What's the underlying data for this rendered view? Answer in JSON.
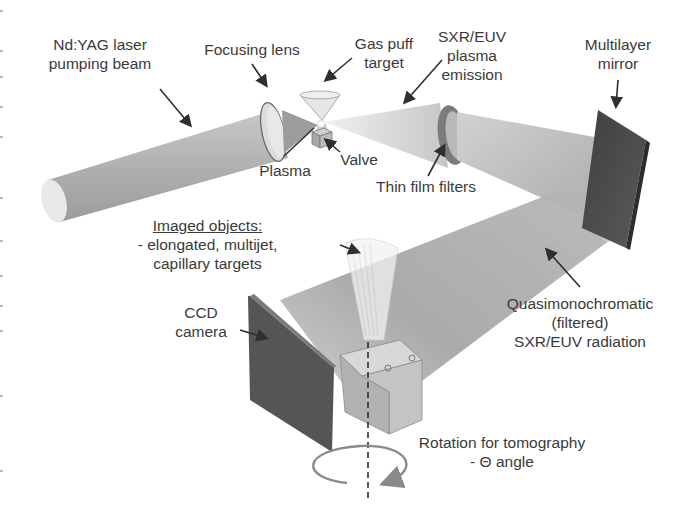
{
  "diagram": {
    "labels": {
      "laser_beam": [
        "Nd:YAG laser",
        "pumping beam"
      ],
      "focusing_lens": [
        "Focusing lens"
      ],
      "gas_puff_target": [
        "Gas puff",
        "target"
      ],
      "plasma_emission": [
        "SXR/EUV",
        "plasma",
        "emission"
      ],
      "multilayer_mirror": [
        "Multilayer",
        "mirror"
      ],
      "plasma": [
        "Plasma"
      ],
      "valve": [
        "Valve"
      ],
      "thin_film_filters": [
        "Thin film filters"
      ],
      "imaged_objects": {
        "heading": "Imaged objects:",
        "lines": [
          "- elongated, multijet,",
          "capillary targets"
        ]
      },
      "ccd_camera": [
        "CCD",
        "camera"
      ],
      "filtered_radiation": [
        "Quasimonochromatic",
        "(filtered)",
        "SXR/EUV radiation"
      ],
      "rotation": [
        "Rotation for tomography",
        "- Θ angle"
      ]
    },
    "colors": {
      "beam_light": "#e8e8e8",
      "beam_mid": "#c4c4c4",
      "beam_dark": "#9a9a9a",
      "mirror": "#4a4a4a",
      "ccd": "#5a5a5a",
      "filter_ring": "#7a7a7a",
      "stage": "#c9c9c9",
      "arrow": "#2f2f2f",
      "rotation_arrow": "#8a8a8a",
      "text": "#3a3a3a"
    }
  }
}
